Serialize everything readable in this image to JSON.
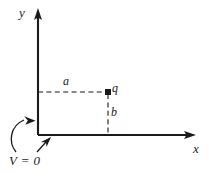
{
  "figure": {
    "type": "physics-diagram",
    "background_color": "#ffffff",
    "stroke_color": "#1a1a1a",
    "axes": {
      "y_axis_label": "y",
      "x_axis_label": "x",
      "origin": {
        "x": 38,
        "y": 135
      },
      "y_axis_tip": {
        "x": 38,
        "y": 10
      },
      "x_axis_tip": {
        "x": 196,
        "y": 135
      }
    },
    "charge": {
      "label": "q",
      "marker": "filled-dot",
      "position": {
        "x": 108,
        "y": 92
      }
    },
    "dimensions": [
      {
        "label": "a",
        "orientation": "horizontal",
        "from": {
          "x": 38,
          "y": 92
        },
        "to": {
          "x": 108,
          "y": 92
        },
        "style": "dashed"
      },
      {
        "label": "b",
        "orientation": "vertical",
        "from": {
          "x": 108,
          "y": 93
        },
        "to": {
          "x": 108,
          "y": 135
        },
        "style": "dashed"
      }
    ],
    "annotation": {
      "label": "V = 0",
      "pointers": [
        {
          "name": "pointer-to-y-axis",
          "target": {
            "x": 36,
            "y": 123
          }
        },
        {
          "name": "pointer-to-x-axis",
          "target": {
            "x": 50,
            "y": 137
          }
        }
      ]
    }
  }
}
